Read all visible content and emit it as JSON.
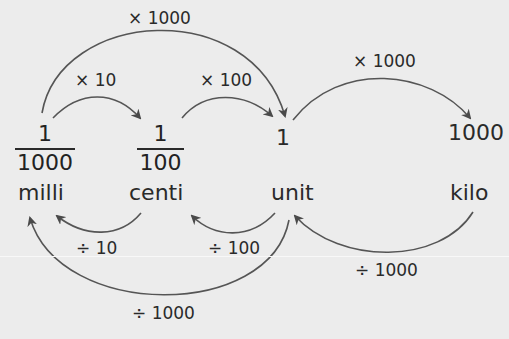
{
  "diagram": {
    "nodes": [
      {
        "id": "milli",
        "value_numerator": "1",
        "value_denominator": "1000",
        "name": "milli"
      },
      {
        "id": "centi",
        "value_numerator": "1",
        "value_denominator": "100",
        "name": "centi"
      },
      {
        "id": "unit",
        "value": "1",
        "name": "unit"
      },
      {
        "id": "kilo",
        "value": "1000",
        "name": "kilo"
      }
    ],
    "multiply_arrows": [
      {
        "from": "milli",
        "to": "centi",
        "label": "× 10"
      },
      {
        "from": "centi",
        "to": "unit",
        "label": "× 100"
      },
      {
        "from": "milli",
        "to": "unit",
        "label": "× 1000"
      },
      {
        "from": "unit",
        "to": "kilo",
        "label": "× 1000"
      }
    ],
    "divide_arrows": [
      {
        "from": "centi",
        "to": "milli",
        "label": "÷ 10"
      },
      {
        "from": "unit",
        "to": "centi",
        "label": "÷ 100"
      },
      {
        "from": "unit",
        "to": "milli",
        "label": "÷ 1000"
      },
      {
        "from": "kilo",
        "to": "unit",
        "label": "÷ 1000"
      }
    ],
    "colors": {
      "background": "#ececec",
      "stroke": "#4a4a4a",
      "text": "#2a2a2a"
    }
  }
}
